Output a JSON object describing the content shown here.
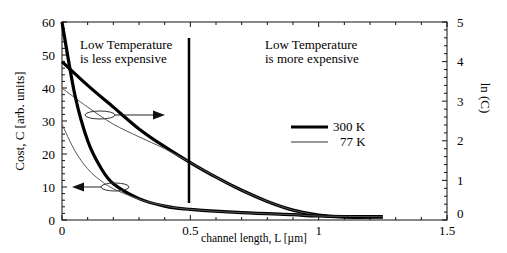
{
  "chart_data": {
    "type": "line",
    "title": "",
    "xlabel": "channel length, L [µm]",
    "ylabel": "Cost, C [arb. units]",
    "y2label": "ln (C)",
    "xlim": [
      0,
      1.5
    ],
    "ylim": [
      0,
      60
    ],
    "y2lim": [
      0,
      5
    ],
    "x_ticks": [
      "0",
      "0.5",
      "1",
      "1.5"
    ],
    "y_ticks": [
      "0",
      "10",
      "20",
      "30",
      "40",
      "50",
      "60"
    ],
    "y2_ticks": [
      "0",
      "1",
      "2",
      "3",
      "4",
      "5"
    ],
    "grid": false,
    "legend": {
      "position": "center-right",
      "entries": [
        {
          "label": "300 K",
          "style": "thick"
        },
        {
          "label": "77 K",
          "style": "thin"
        }
      ]
    },
    "annotations": [
      {
        "text_line1": "Low Temperature",
        "text_line2": "is less expensive",
        "x": 0.12,
        "y": 52
      },
      {
        "text_line1": "Low Temperature",
        "text_line2": "is more expensive",
        "x": 0.8,
        "y": 52
      },
      {
        "type": "vertical-line",
        "x": 0.5,
        "y_from": 5,
        "y_to": 55
      },
      {
        "type": "ellipse-arrow",
        "points_to": "right axis ln(C)",
        "at": [
          0.2,
          26.5
        ]
      },
      {
        "type": "ellipse-arrow",
        "points_to": "left axis Cost",
        "at": [
          0.2,
          10
        ]
      }
    ],
    "series": [
      {
        "name": "300 K ln(C)",
        "axis": "right",
        "style": "thick",
        "x": [
          0,
          0.1,
          0.2,
          0.3,
          0.4,
          0.5,
          0.6,
          0.7,
          0.8,
          0.9,
          1.0,
          1.1,
          1.25
        ],
        "values": [
          4.0,
          3.4,
          2.85,
          2.3,
          1.85,
          1.45,
          1.08,
          0.75,
          0.47,
          0.25,
          0.12,
          0.07,
          0.07
        ]
      },
      {
        "name": "77 K ln(C)",
        "axis": "right",
        "style": "thin",
        "x": [
          0,
          0.1,
          0.2,
          0.3,
          0.4,
          0.5,
          0.6,
          0.7,
          0.8,
          0.9,
          1.0,
          1.1,
          1.25
        ],
        "values": [
          3.33,
          2.85,
          2.42,
          2.1,
          1.8,
          1.45,
          1.08,
          0.75,
          0.47,
          0.25,
          0.12,
          0.07,
          0.07
        ]
      },
      {
        "name": "300 K Cost",
        "axis": "left",
        "style": "thick",
        "x": [
          0,
          0.05,
          0.1,
          0.15,
          0.2,
          0.3,
          0.4,
          0.5,
          0.7,
          0.9,
          1.0,
          1.25
        ],
        "values": [
          60,
          38,
          24,
          16,
          11,
          6.5,
          4.2,
          3.2,
          2.2,
          1.6,
          1.2,
          1.0
        ]
      },
      {
        "name": "77 K Cost",
        "axis": "left",
        "style": "thin",
        "x": [
          0,
          0.05,
          0.1,
          0.15,
          0.2,
          0.3,
          0.4,
          0.5,
          0.7,
          0.9,
          1.0,
          1.25
        ],
        "values": [
          29,
          21,
          15.5,
          12,
          9.5,
          6.3,
          4.3,
          3.2,
          2.2,
          1.6,
          1.2,
          1.0
        ]
      }
    ]
  }
}
